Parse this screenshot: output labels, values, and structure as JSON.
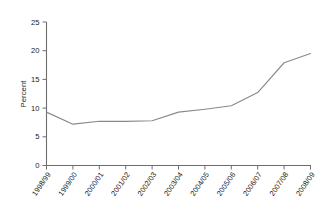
{
  "chart_data": {
    "type": "line",
    "title": "",
    "xlabel": "",
    "ylabel": "Percent",
    "ylim": [
      0,
      25
    ],
    "yticks": [
      0,
      5,
      10,
      15,
      20,
      25
    ],
    "ytick_labels": [
      "0",
      "5",
      "10",
      "15",
      "20",
      "25"
    ],
    "grid": false,
    "legend": null,
    "categories": [
      "1998/99",
      "1999/00",
      "2000/01",
      "2001/02",
      "2002/03",
      "2003/04",
      "2004/05",
      "2005/06",
      "2006/07",
      "2007/08",
      "2008/09"
    ],
    "values": [
      9.3,
      7.2,
      7.7,
      7.7,
      7.8,
      9.3,
      9.8,
      10.4,
      12.7,
      17.9,
      19.5
    ],
    "series": [
      {
        "name": "Percent",
        "color": "#8a8a8a",
        "values": [
          9.3,
          7.2,
          7.7,
          7.7,
          7.8,
          9.3,
          9.8,
          10.4,
          12.7,
          17.9,
          19.5
        ]
      }
    ],
    "colors": {
      "line": "#8a8a8a",
      "axis": "#6e6e6e",
      "text": "#1a1a1a",
      "background": "#ffffff"
    }
  }
}
